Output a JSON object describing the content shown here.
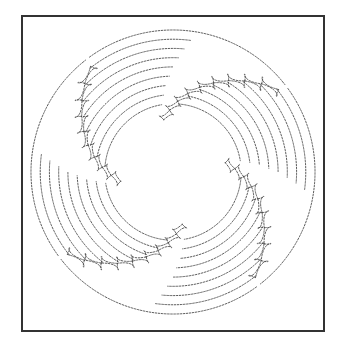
{
  "artwork": {
    "description": "Circular quilting pattern, dotted stitch lines, 4-fold rotational feather design",
    "colors": {
      "background": "#ffffff",
      "frame": "#333333",
      "stitch": "#4a4a4a"
    },
    "frame": {
      "left": 21,
      "top": 15,
      "width": 300,
      "height": 313
    },
    "center": {
      "x": 173,
      "y": 172
    },
    "outer_radius": 142,
    "inner_radius": 47,
    "segments": 4,
    "segment_start_angle_deg": -100,
    "feathers_per_segment": 9,
    "arcs_per_segment": 8
  }
}
